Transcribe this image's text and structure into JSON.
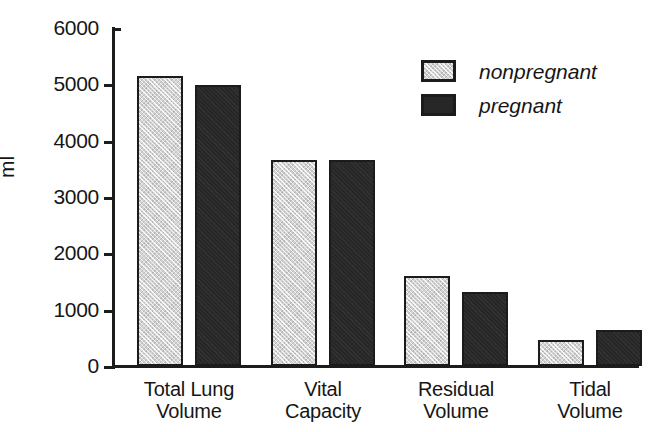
{
  "chart_data": {
    "type": "bar",
    "title": "",
    "xlabel": "",
    "ylabel": "ml",
    "ylim": [
      0,
      6000
    ],
    "yticks": [
      0,
      1000,
      2000,
      3000,
      4000,
      5000,
      6000
    ],
    "ytick_labels": [
      "0",
      "1000",
      "2000",
      "3000",
      "4000",
      "5000",
      "6000"
    ],
    "grid": false,
    "legend_position": "upper right",
    "categories": [
      "Total Lung\nVolume",
      "Vital\nCapacity",
      "Residual\nVolume",
      "Tidal\nVolume"
    ],
    "series": [
      {
        "name": "nonpregnant",
        "color": "#d2d2d2",
        "values": [
          5150,
          3650,
          1590,
          460
        ]
      },
      {
        "name": "pregnant",
        "color": "#272727",
        "values": [
          4980,
          3650,
          1310,
          640
        ]
      }
    ]
  },
  "axis": {
    "y_title": "ml",
    "ticks": [
      {
        "label": "6000",
        "value": 6000
      },
      {
        "label": "5000",
        "value": 5000
      },
      {
        "label": "4000",
        "value": 4000
      },
      {
        "label": "3000",
        "value": 3000
      },
      {
        "label": "2000",
        "value": 2000
      },
      {
        "label": "1000",
        "value": 1000
      },
      {
        "label": "0",
        "value": 0
      }
    ]
  },
  "legend": {
    "items": [
      {
        "label": "nonpregnant",
        "style": "light"
      },
      {
        "label": "pregnant",
        "style": "dark"
      }
    ]
  },
  "categories": [
    {
      "label": "Total Lung\nVolume"
    },
    {
      "label": "Vital\nCapacity"
    },
    {
      "label": "Residual\nVolume"
    },
    {
      "label": "Tidal\nVolume"
    }
  ]
}
